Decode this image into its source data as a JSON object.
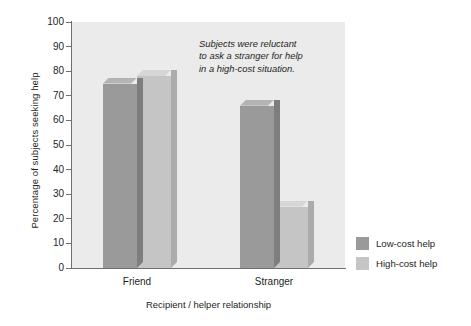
{
  "chart_data": {
    "type": "bar",
    "title": "",
    "xlabel": "Recipient / helper relationship",
    "ylabel": "Percentage of subjects seeking help",
    "categories": [
      "Friend",
      "Stranger"
    ],
    "series": [
      {
        "name": "Low-cost help",
        "values": [
          75,
          66
        ],
        "color": "#9a9a9a"
      },
      {
        "name": "High-cost help",
        "values": [
          78,
          25
        ],
        "color": "#c5c5c5"
      }
    ],
    "ylim": [
      0,
      100
    ],
    "yticks": [
      0,
      10,
      20,
      30,
      40,
      50,
      60,
      70,
      80,
      90,
      100
    ],
    "ytick_labels": [
      "0",
      "10",
      "20",
      "30",
      "40",
      "50",
      "60",
      "70",
      "80",
      "90",
      "100"
    ],
    "grid": false,
    "legend_position": "right",
    "annotations": [
      {
        "lines": [
          "Subjects were reluctant",
          "to ask a stranger for help",
          "in a high-cost situation."
        ]
      }
    ],
    "plot_background": "#ebebeb",
    "axis_color": "#6f6f6f"
  }
}
